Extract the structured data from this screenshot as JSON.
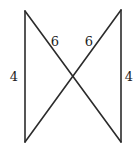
{
  "figure": {
    "labels": {
      "left_vertical": "4",
      "right_vertical": "4",
      "upper_left_diagonal": "6",
      "upper_right_diagonal": "6"
    }
  }
}
